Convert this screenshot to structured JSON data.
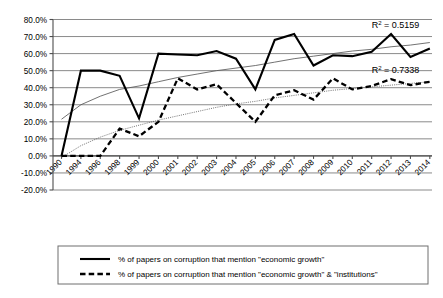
{
  "chart_data": {
    "type": "line",
    "title": "",
    "subtitle": "",
    "xlabel": "",
    "ylabel": "",
    "grid": true,
    "legend_position": "bottom",
    "ylim": [
      -20,
      80
    ],
    "ytick_values": [
      80,
      70,
      60,
      50,
      40,
      30,
      20,
      10,
      0,
      -10,
      -20
    ],
    "ytick_labels": [
      "80.0%",
      "70.0%",
      "60.0%",
      "50.0%",
      "40.0%",
      "30.0%",
      "20.0%",
      "10.0%",
      "0.0%",
      "-10.0%",
      "-20.0%"
    ],
    "categories": [
      "1990",
      "1994",
      "1996",
      "1998",
      "1999",
      "2000",
      "2001",
      "2002",
      "2003",
      "2004",
      "2005",
      "2006",
      "2007",
      "2008",
      "2009",
      "2010",
      "2011",
      "2012",
      "2013",
      "2014"
    ],
    "series": [
      {
        "name": "% of papers on corruption that mention \"economic growth\"",
        "style": "solid",
        "values": [
          0.0,
          50.0,
          50.0,
          47.0,
          22.0,
          60.0,
          59.5,
          59.0,
          61.5,
          57.0,
          39.0,
          68.0,
          71.5,
          53.0,
          59.0,
          58.5,
          61.0,
          71.5,
          58.0,
          63.0
        ]
      },
      {
        "name": "% of papers on corruption that mention \"economic growth\" & \"institutions\"",
        "style": "dashed",
        "values": [
          0.0,
          0.0,
          0.0,
          16.0,
          11.5,
          20.0,
          45.5,
          39.0,
          42.0,
          31.0,
          20.0,
          35.5,
          38.5,
          33.0,
          45.5,
          39.0,
          41.0,
          45.0,
          41.5,
          43.5
        ]
      }
    ],
    "trendlines": [
      {
        "for_series": "% of papers on corruption that mention \"economic growth\"",
        "style": "solid-thin",
        "r2_label": "R2 = 0.5159",
        "r2_prefix": "R",
        "r2_sup": "2",
        "r2_value": "= 0.5159",
        "points": [
          21.5,
          30.0,
          35.0,
          39.0,
          41.0,
          43.5,
          46.0,
          48.0,
          50.0,
          51.5,
          53.0,
          55.0,
          57.0,
          58.5,
          60.0,
          61.5,
          62.5,
          64.0,
          65.0,
          66.5
        ]
      },
      {
        "for_series": "% of papers on corruption that mention \"economic growth\" & \"institutions\"",
        "style": "dotted-thin",
        "r2_label": "R2 = 0.7338",
        "r2_prefix": "R",
        "r2_sup": "2",
        "r2_value": "= 0.7338",
        "points": [
          -1.0,
          6.0,
          11.0,
          15.0,
          18.0,
          21.0,
          23.5,
          26.0,
          28.5,
          30.5,
          32.0,
          34.0,
          35.5,
          37.0,
          38.5,
          39.5,
          40.5,
          41.5,
          42.5,
          43.5
        ]
      }
    ],
    "annotations": [
      {
        "text": "R2 = 0.5159",
        "x_category": "2011",
        "y_value": 75.0
      },
      {
        "text": "R2 = 0.7338",
        "x_category": "2011",
        "y_value": 48.5
      }
    ],
    "colors": {
      "series_solid": "#000000",
      "series_dashed": "#000000",
      "trend": "#595959",
      "gridline": "#8a8a8a",
      "axis": "#4d4d4d",
      "background": "#ffffff"
    }
  },
  "legend": {
    "items": [
      {
        "label": "% of papers on corruption that mention \"economic growth\"",
        "style": "solid"
      },
      {
        "label": "% of papers on corruption that mention \"economic growth\" & \"institutions\"",
        "style": "dashed"
      }
    ]
  }
}
